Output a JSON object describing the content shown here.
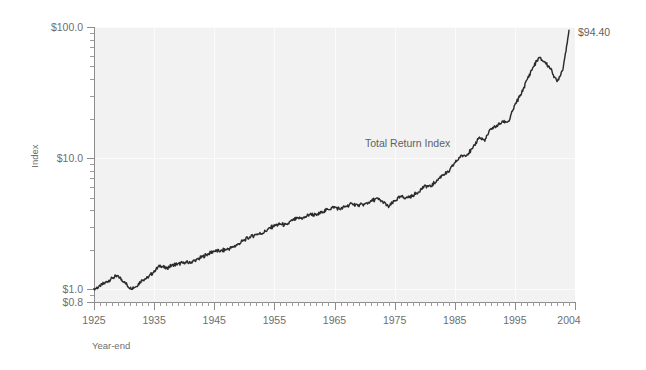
{
  "chart_data": {
    "type": "line",
    "title": "",
    "xlabel": "Year-end",
    "ylabel": "Index",
    "yscale": "log",
    "ylim": [
      0.8,
      100.0
    ],
    "xlim": [
      1925,
      2005
    ],
    "grid": true,
    "legend_position": "none",
    "y_tick_labels": [
      "$100.0",
      "$10.0",
      "$1.0",
      "$0.8"
    ],
    "y_tick_values": [
      100.0,
      10.0,
      1.0,
      0.8
    ],
    "x_tick_labels": [
      "1925",
      "1935",
      "1945",
      "1955",
      "1965",
      "1975",
      "1985",
      "1995",
      "2004"
    ],
    "x_tick_values": [
      1925,
      1935,
      1945,
      1955,
      1965,
      1975,
      1985,
      1995,
      2004
    ],
    "annotations": [
      {
        "text": "Total Return Index",
        "x": 1969,
        "y": 12.5
      },
      {
        "text": "$94.40",
        "x": 2006,
        "y": 82.0
      }
    ],
    "series": [
      {
        "name": "Total Return Index",
        "color": "#2b2b2b",
        "x": [
          1925,
          1926,
          1927,
          1928,
          1929,
          1930,
          1931,
          1932,
          1933,
          1934,
          1935,
          1936,
          1937,
          1938,
          1939,
          1940,
          1941,
          1942,
          1943,
          1944,
          1945,
          1946,
          1947,
          1948,
          1949,
          1950,
          1951,
          1952,
          1953,
          1954,
          1955,
          1956,
          1957,
          1958,
          1959,
          1960,
          1961,
          1962,
          1963,
          1964,
          1965,
          1966,
          1967,
          1968,
          1969,
          1970,
          1971,
          1972,
          1973,
          1974,
          1975,
          1976,
          1977,
          1978,
          1979,
          1980,
          1981,
          1982,
          1983,
          1984,
          1985,
          1986,
          1987,
          1988,
          1989,
          1990,
          1991,
          1992,
          1993,
          1994,
          1995,
          1996,
          1997,
          1998,
          1999,
          2000,
          2001,
          2002,
          2003,
          2004
        ],
        "values": [
          1.0,
          1.06,
          1.13,
          1.22,
          1.26,
          1.14,
          1.02,
          1.05,
          1.18,
          1.23,
          1.37,
          1.52,
          1.44,
          1.53,
          1.56,
          1.59,
          1.6,
          1.67,
          1.77,
          1.86,
          1.96,
          1.95,
          2.01,
          2.09,
          2.21,
          2.37,
          2.51,
          2.63,
          2.67,
          2.88,
          3.06,
          3.14,
          3.09,
          3.36,
          3.48,
          3.52,
          3.76,
          3.67,
          3.89,
          4.08,
          4.24,
          4.08,
          4.31,
          4.49,
          4.35,
          4.44,
          4.68,
          4.92,
          4.66,
          4.24,
          4.72,
          5.08,
          5.01,
          5.16,
          5.55,
          6.14,
          6.08,
          6.72,
          7.48,
          7.82,
          9.21,
          10.35,
          10.62,
          11.82,
          14.4,
          13.62,
          16.72,
          17.6,
          18.98,
          19.06,
          25.45,
          30.48,
          39.46,
          49.12,
          58.36,
          53.94,
          47.88,
          38.11,
          48.05,
          94.4
        ]
      }
    ]
  },
  "axis": {
    "y_title": "Index",
    "x_title": "Year-end"
  }
}
